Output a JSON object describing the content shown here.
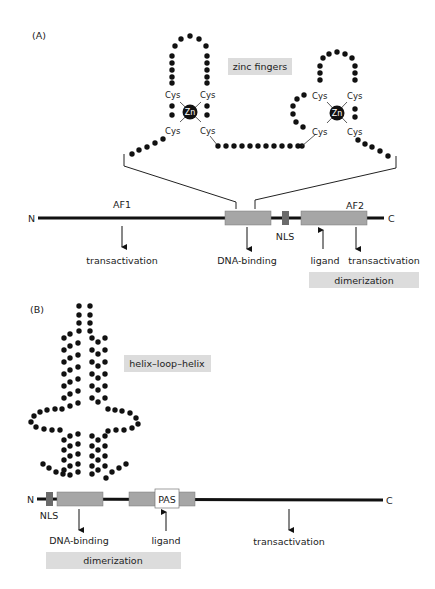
{
  "panel_a": {
    "label": "(A)",
    "title_box": "zinc fingers",
    "cys_label": "Cys",
    "zn_label": "Zn",
    "n_terminus": "N",
    "c_terminus": "C",
    "af1": "AF1",
    "af2": "AF2",
    "nls": "NLS",
    "annotations": {
      "transactivation_1": "transactivation",
      "dna_binding": "DNA-binding",
      "ligand": "ligand",
      "transactivation_2": "transactivation",
      "dimerization": "dimerization"
    }
  },
  "panel_b": {
    "label": "(B)",
    "title_box": "helix–loop–helix",
    "n_terminus": "N",
    "c_terminus": "C",
    "nls": "NLS",
    "pas": "PAS",
    "annotations": {
      "dna_binding": "DNA-binding",
      "ligand": "ligand",
      "transactivation": "transactivation",
      "dimerization": "dimerization"
    }
  },
  "colors": {
    "domain_fill": "#a6a6a6",
    "nls_fill": "#6b6b6b",
    "label_box": "#dcdcdc",
    "strand": "#111111"
  }
}
